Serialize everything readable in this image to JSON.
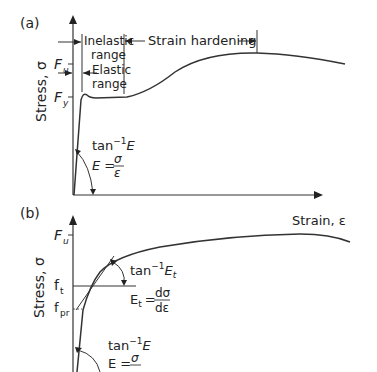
{
  "panel_a": {
    "label": "(a)",
    "y_axis_label": "Stress, σ",
    "x_axis_label": "Strain, ε",
    "ticks": {
      "fu": "F",
      "fu_sub": "u",
      "fy": "F",
      "fy_sub": "y"
    },
    "inelastic_line1": "Inelastic",
    "inelastic_line2": "range",
    "elastic_line1": "Elastic",
    "elastic_line2": "range",
    "strain_hardening": "Strain hardening",
    "slope_label_main": "tan",
    "slope_label_sup": "−1",
    "slope_label_E": "E",
    "modulus_lhs": "E =",
    "modulus_num": "σ",
    "modulus_den": "ε"
  },
  "panel_b": {
    "label": "(b)",
    "y_axis_label": "Stress, σ",
    "ticks": {
      "fu": "F",
      "fu_sub": "u",
      "ft": "f",
      "ft_sub": "t",
      "fpr": "f",
      "fpr_sub": "pr"
    },
    "tangent_label_main": "tan",
    "tangent_label_sup": "−1",
    "tangent_label_E": "E",
    "tangent_label_sub": "t",
    "tangent_eq_lhs": "E",
    "tangent_eq_lhs_sub": "t",
    "tangent_eq_eq": "=",
    "tangent_eq_num": "dσ",
    "tangent_eq_den": "dε",
    "slope_label_main": "tan",
    "slope_label_sup": "−1",
    "slope_label_E": "E",
    "modulus_lhs": "E =",
    "modulus_num": "σ",
    "modulus_den": "σ"
  }
}
